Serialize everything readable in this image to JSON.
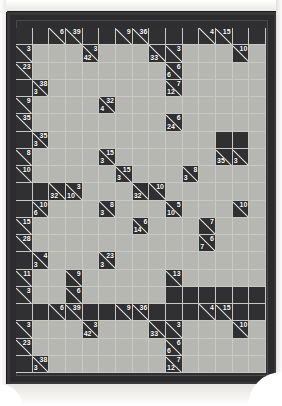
{
  "puzzle": {
    "type": "kakuro",
    "title": "Kakuro Grid",
    "columns": 15,
    "rows": 20,
    "colors": {
      "frame": "#2b2b2d",
      "clue_cell": "#303032",
      "block_cell": "#303032",
      "open_cell": "#b6b6b2",
      "grid_line": "#c9c9c4",
      "clue_text": "#ffffff",
      "page": "#fbfbfa"
    },
    "legend": {
      "across_label": "across (right) clue, printed upper-right of the diagonal",
      "down_label": "down clue, printed lower-left of the diagonal"
    },
    "cells": [
      [
        {
          "t": "block"
        },
        {
          "t": "block"
        },
        {
          "t": "clue",
          "r": "6"
        },
        {
          "t": "clue",
          "r": "39"
        },
        {
          "t": "block"
        },
        {
          "t": "block"
        },
        {
          "t": "clue",
          "r": "9"
        },
        {
          "t": "clue",
          "r": "36"
        },
        {
          "t": "block"
        },
        {
          "t": "block"
        },
        {
          "t": "block"
        },
        {
          "t": "clue",
          "r": "4"
        },
        {
          "t": "clue",
          "r": "15"
        },
        {
          "t": "block"
        },
        {
          "t": "block"
        }
      ],
      [
        {
          "t": "clue",
          "r": "3"
        },
        {
          "t": "open"
        },
        {
          "t": "open"
        },
        {
          "t": "open"
        },
        {
          "t": "clue",
          "r": "3",
          "d": "42"
        },
        {
          "t": "open"
        },
        {
          "t": "open"
        },
        {
          "t": "open"
        },
        {
          "t": "clue",
          "d": "33"
        },
        {
          "t": "clue",
          "r": "3"
        },
        {
          "t": "open"
        },
        {
          "t": "open"
        },
        {
          "t": "open"
        },
        {
          "t": "clue",
          "r": "10"
        },
        {
          "t": "open"
        }
      ],
      [
        {
          "t": "clue",
          "r": "23"
        },
        {
          "t": "open"
        },
        {
          "t": "open"
        },
        {
          "t": "open"
        },
        {
          "t": "open"
        },
        {
          "t": "open"
        },
        {
          "t": "open"
        },
        {
          "t": "open"
        },
        {
          "t": "open"
        },
        {
          "t": "clue",
          "r": "6",
          "d": "6"
        },
        {
          "t": "open"
        },
        {
          "t": "open"
        },
        {
          "t": "open"
        },
        {
          "t": "open"
        },
        {
          "t": "open"
        }
      ],
      [
        {
          "t": "block"
        },
        {
          "t": "clue",
          "r": "38",
          "d": "3"
        },
        {
          "t": "open"
        },
        {
          "t": "open"
        },
        {
          "t": "open"
        },
        {
          "t": "open"
        },
        {
          "t": "open"
        },
        {
          "t": "open"
        },
        {
          "t": "open"
        },
        {
          "t": "clue",
          "r": "7",
          "d": "12"
        },
        {
          "t": "open"
        },
        {
          "t": "open"
        },
        {
          "t": "open"
        },
        {
          "t": "open"
        },
        {
          "t": "open"
        }
      ],
      [
        {
          "t": "clue",
          "r": "9"
        },
        {
          "t": "open"
        },
        {
          "t": "open"
        },
        {
          "t": "open"
        },
        {
          "t": "open"
        },
        {
          "t": "clue",
          "r": "32",
          "d": "4"
        },
        {
          "t": "open"
        },
        {
          "t": "open"
        },
        {
          "t": "open"
        },
        {
          "t": "open"
        },
        {
          "t": "open"
        },
        {
          "t": "open"
        },
        {
          "t": "open"
        },
        {
          "t": "open"
        },
        {
          "t": "open"
        }
      ],
      [
        {
          "t": "clue",
          "r": "35"
        },
        {
          "t": "open"
        },
        {
          "t": "open"
        },
        {
          "t": "open"
        },
        {
          "t": "open"
        },
        {
          "t": "open"
        },
        {
          "t": "open"
        },
        {
          "t": "open"
        },
        {
          "t": "open"
        },
        {
          "t": "clue",
          "r": "6",
          "d": "24"
        },
        {
          "t": "open"
        },
        {
          "t": "open"
        },
        {
          "t": "open"
        },
        {
          "t": "open"
        },
        {
          "t": "open"
        }
      ],
      [
        {
          "t": "block"
        },
        {
          "t": "clue",
          "r": "35",
          "d": "3"
        },
        {
          "t": "open"
        },
        {
          "t": "open"
        },
        {
          "t": "open"
        },
        {
          "t": "open"
        },
        {
          "t": "open"
        },
        {
          "t": "open"
        },
        {
          "t": "open"
        },
        {
          "t": "open"
        },
        {
          "t": "open"
        },
        {
          "t": "open"
        },
        {
          "t": "block"
        },
        {
          "t": "block"
        },
        {
          "t": "open"
        }
      ],
      [
        {
          "t": "clue",
          "r": "8"
        },
        {
          "t": "open"
        },
        {
          "t": "open"
        },
        {
          "t": "open"
        },
        {
          "t": "open"
        },
        {
          "t": "clue",
          "r": "15",
          "d": "3"
        },
        {
          "t": "open"
        },
        {
          "t": "open"
        },
        {
          "t": "open"
        },
        {
          "t": "open"
        },
        {
          "t": "open"
        },
        {
          "t": "open"
        },
        {
          "t": "clue",
          "d": "35"
        },
        {
          "t": "clue",
          "d": "3"
        },
        {
          "t": "open"
        }
      ],
      [
        {
          "t": "clue",
          "r": "10"
        },
        {
          "t": "open"
        },
        {
          "t": "open"
        },
        {
          "t": "open"
        },
        {
          "t": "open"
        },
        {
          "t": "open"
        },
        {
          "t": "clue",
          "r": "15",
          "d": "3"
        },
        {
          "t": "open"
        },
        {
          "t": "open"
        },
        {
          "t": "open"
        },
        {
          "t": "clue",
          "r": "8",
          "d": "3"
        },
        {
          "t": "open"
        },
        {
          "t": "open"
        },
        {
          "t": "open"
        },
        {
          "t": "open"
        }
      ],
      [
        {
          "t": "block"
        },
        {
          "t": "block"
        },
        {
          "t": "clue",
          "d": "32"
        },
        {
          "t": "clue",
          "r": "3",
          "d": "10"
        },
        {
          "t": "open"
        },
        {
          "t": "open"
        },
        {
          "t": "open"
        },
        {
          "t": "clue",
          "d": "32"
        },
        {
          "t": "clue",
          "r": "10"
        },
        {
          "t": "open"
        },
        {
          "t": "open"
        },
        {
          "t": "open"
        },
        {
          "t": "open"
        },
        {
          "t": "open"
        },
        {
          "t": "open"
        }
      ],
      [
        {
          "t": "block"
        },
        {
          "t": "clue",
          "r": "10",
          "d": "6"
        },
        {
          "t": "open"
        },
        {
          "t": "open"
        },
        {
          "t": "open"
        },
        {
          "t": "clue",
          "r": "8",
          "d": "3"
        },
        {
          "t": "open"
        },
        {
          "t": "open"
        },
        {
          "t": "open"
        },
        {
          "t": "clue",
          "r": "5",
          "d": "10"
        },
        {
          "t": "open"
        },
        {
          "t": "open"
        },
        {
          "t": "open"
        },
        {
          "t": "clue",
          "r": "10"
        },
        {
          "t": "open"
        }
      ],
      [
        {
          "t": "clue",
          "r": "15"
        },
        {
          "t": "open"
        },
        {
          "t": "open"
        },
        {
          "t": "open"
        },
        {
          "t": "open"
        },
        {
          "t": "open"
        },
        {
          "t": "open"
        },
        {
          "t": "clue",
          "r": "6",
          "d": "14"
        },
        {
          "t": "open"
        },
        {
          "t": "open"
        },
        {
          "t": "open"
        },
        {
          "t": "clue",
          "r": "7"
        },
        {
          "t": "open"
        },
        {
          "t": "open"
        },
        {
          "t": "open"
        }
      ],
      [
        {
          "t": "clue",
          "r": "28"
        },
        {
          "t": "open"
        },
        {
          "t": "open"
        },
        {
          "t": "open"
        },
        {
          "t": "open"
        },
        {
          "t": "open"
        },
        {
          "t": "open"
        },
        {
          "t": "open"
        },
        {
          "t": "open"
        },
        {
          "t": "open"
        },
        {
          "t": "open"
        },
        {
          "t": "clue",
          "r": "6",
          "d": "7"
        },
        {
          "t": "open"
        },
        {
          "t": "open"
        },
        {
          "t": "open"
        }
      ],
      [
        {
          "t": "block"
        },
        {
          "t": "clue",
          "r": "4",
          "d": "3"
        },
        {
          "t": "open"
        },
        {
          "t": "open"
        },
        {
          "t": "open"
        },
        {
          "t": "clue",
          "r": "23",
          "d": "3"
        },
        {
          "t": "open"
        },
        {
          "t": "open"
        },
        {
          "t": "open"
        },
        {
          "t": "open"
        },
        {
          "t": "open"
        },
        {
          "t": "open"
        },
        {
          "t": "open"
        },
        {
          "t": "open"
        },
        {
          "t": "open"
        }
      ],
      [
        {
          "t": "clue",
          "r": "11"
        },
        {
          "t": "open"
        },
        {
          "t": "open"
        },
        {
          "t": "clue",
          "r": "9"
        },
        {
          "t": "open"
        },
        {
          "t": "open"
        },
        {
          "t": "open"
        },
        {
          "t": "open"
        },
        {
          "t": "open"
        },
        {
          "t": "clue",
          "r": "13"
        },
        {
          "t": "open"
        },
        {
          "t": "open"
        },
        {
          "t": "open"
        },
        {
          "t": "open"
        },
        {
          "t": "open"
        }
      ],
      [
        {
          "t": "clue",
          "r": "3"
        },
        {
          "t": "open"
        },
        {
          "t": "open"
        },
        {
          "t": "clue",
          "r": "6"
        },
        {
          "t": "open"
        },
        {
          "t": "open"
        },
        {
          "t": "open"
        },
        {
          "t": "open"
        },
        {
          "t": "open"
        },
        {
          "t": "block"
        },
        {
          "t": "block"
        },
        {
          "t": "block"
        },
        {
          "t": "block"
        },
        {
          "t": "block"
        },
        {
          "t": "block"
        }
      ]
    ]
  }
}
